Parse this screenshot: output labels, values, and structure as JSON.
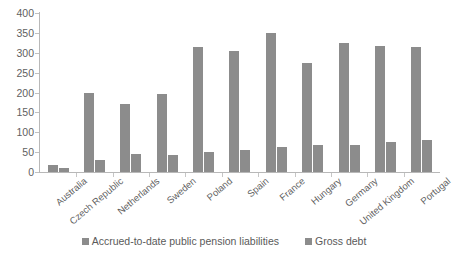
{
  "chart_data": {
    "type": "bar",
    "title": "",
    "subtitle": "",
    "xlabel": "",
    "ylabel": "",
    "ylim": [
      0,
      400
    ],
    "ytick_labels": [
      "400",
      "350",
      "300",
      "250",
      "200",
      "150",
      "100",
      "50",
      "0"
    ],
    "ytick_values": [
      400,
      350,
      300,
      250,
      200,
      150,
      100,
      50,
      0
    ],
    "grid": false,
    "legend_position": "bottom",
    "categories": [
      "Australia",
      "Czech Republic",
      "Netherlands",
      "Sweden",
      "Poland",
      "Spain",
      "France",
      "Hungary",
      "Germany",
      "United Kingdom",
      "Portugal"
    ],
    "series": [
      {
        "name": "Accrued-to-date public pension liabilities",
        "color": "#8c8c8c",
        "values": [
          18,
          200,
          170,
          197,
          315,
          305,
          350,
          275,
          325,
          317,
          315
        ]
      },
      {
        "name": "Gross debt",
        "color": "#8c8c8c",
        "values": [
          10,
          30,
          45,
          42,
          50,
          55,
          62,
          67,
          68,
          75,
          80
        ]
      }
    ]
  },
  "legend": {
    "items": [
      {
        "label": "Accrued-to-date public pension liabilities"
      },
      {
        "label": "Gross debt"
      }
    ]
  }
}
